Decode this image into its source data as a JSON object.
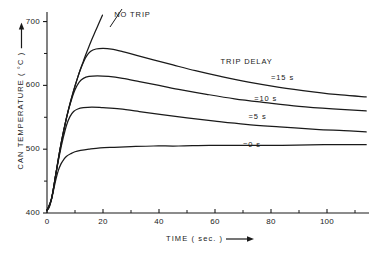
{
  "chart_data": {
    "type": "line",
    "title": "",
    "xlabel": "TIME ( sec. )",
    "ylabel": "CAN TEMPERATURE ( °C )",
    "xlim": [
      0,
      115
    ],
    "ylim": [
      400,
      715
    ],
    "xticks": [
      0,
      20,
      40,
      60,
      80,
      100
    ],
    "xtick_labels": [
      "0",
      "20",
      "40",
      "60",
      "80",
      "100"
    ],
    "xminor": [
      10,
      30,
      50,
      70,
      90,
      110
    ],
    "yticks": [
      400,
      500,
      600,
      700
    ],
    "ytick_labels": [
      "400",
      "500",
      "600",
      "700"
    ],
    "yminor": [
      450,
      550,
      650
    ],
    "grid": false,
    "legend_position": "inline-annotations",
    "annotations": [
      {
        "text": "NO  TRIP",
        "x": 24,
        "y": 710
      },
      {
        "text": "TRIP  DELAY",
        "x": 62,
        "y": 637
      },
      {
        "text": "=15 s",
        "x": 80,
        "y": 612
      },
      {
        "text": "=10 s",
        "x": 74,
        "y": 579
      },
      {
        "text": "=5 s",
        "x": 72,
        "y": 550
      },
      {
        "text": "=0 s",
        "x": 70,
        "y": 507
      }
    ],
    "series": [
      {
        "name": "NO TRIP",
        "points": [
          [
            0.0,
            404
          ],
          [
            0.8,
            410
          ],
          [
            1.6,
            422
          ],
          [
            2.4,
            440
          ],
          [
            3.2,
            462
          ],
          [
            4.0,
            484
          ],
          [
            5.0,
            508
          ],
          [
            6.0,
            530
          ],
          [
            7.0,
            550
          ],
          [
            8.0,
            568
          ],
          [
            9.0,
            584
          ],
          [
            10.0,
            599
          ],
          [
            11.0,
            613
          ],
          [
            12.0,
            626
          ],
          [
            13.0,
            638
          ],
          [
            14.0,
            650
          ],
          [
            15.0,
            661
          ],
          [
            16.0,
            672
          ],
          [
            17.0,
            682
          ],
          [
            18.0,
            692
          ],
          [
            19.0,
            702
          ],
          [
            19.8,
            710
          ]
        ]
      },
      {
        "name": "TRIP DELAY = 15 s",
        "points": [
          [
            0.0,
            404
          ],
          [
            1.6,
            422
          ],
          [
            3.2,
            462
          ],
          [
            5.0,
            508
          ],
          [
            7.0,
            550
          ],
          [
            9.0,
            584
          ],
          [
            11.0,
            613
          ],
          [
            12.5,
            631
          ],
          [
            14.0,
            645
          ],
          [
            15.5,
            653
          ],
          [
            17.5,
            657
          ],
          [
            20.0,
            658
          ],
          [
            23.0,
            657
          ],
          [
            27.0,
            653
          ],
          [
            32.0,
            647
          ],
          [
            38.0,
            640
          ],
          [
            45.0,
            632
          ],
          [
            53.0,
            623
          ],
          [
            62.0,
            614
          ],
          [
            72.0,
            605
          ],
          [
            83.0,
            597
          ],
          [
            95.0,
            590
          ],
          [
            105.0,
            585
          ],
          [
            114.0,
            582
          ]
        ]
      },
      {
        "name": "TRIP DELAY = 10 s",
        "points": [
          [
            0.0,
            404
          ],
          [
            1.6,
            422
          ],
          [
            3.2,
            462
          ],
          [
            5.0,
            508
          ],
          [
            7.0,
            550
          ],
          [
            8.5,
            574
          ],
          [
            10.0,
            593
          ],
          [
            11.5,
            605
          ],
          [
            13.0,
            611
          ],
          [
            15.0,
            614
          ],
          [
            18.0,
            615
          ],
          [
            22.0,
            614
          ],
          [
            27.0,
            611
          ],
          [
            33.0,
            606
          ],
          [
            40.0,
            600
          ],
          [
            48.0,
            593
          ],
          [
            57.0,
            586
          ],
          [
            67.0,
            579
          ],
          [
            78.0,
            573
          ],
          [
            90.0,
            567
          ],
          [
            102.0,
            563
          ],
          [
            114.0,
            560
          ]
        ]
      },
      {
        "name": "TRIP DELAY = 5 s",
        "points": [
          [
            0.0,
            404
          ],
          [
            1.6,
            422
          ],
          [
            3.2,
            462
          ],
          [
            4.5,
            492
          ],
          [
            5.8,
            518
          ],
          [
            7.0,
            538
          ],
          [
            8.2,
            551
          ],
          [
            9.5,
            559
          ],
          [
            11.0,
            563
          ],
          [
            13.0,
            565
          ],
          [
            16.0,
            566
          ],
          [
            20.0,
            565
          ],
          [
            26.0,
            563
          ],
          [
            33.0,
            559
          ],
          [
            41.0,
            554
          ],
          [
            50.0,
            549
          ],
          [
            60.0,
            544
          ],
          [
            71.0,
            539
          ],
          [
            83.0,
            535
          ],
          [
            96.0,
            531
          ],
          [
            106.0,
            529
          ],
          [
            114.0,
            527
          ]
        ]
      },
      {
        "name": "TRIP DELAY = 0 s",
        "points": [
          [
            0.0,
            404
          ],
          [
            0.8,
            409
          ],
          [
            1.6,
            421
          ],
          [
            2.4,
            437
          ],
          [
            3.2,
            453
          ],
          [
            4.0,
            466
          ],
          [
            5.0,
            477
          ],
          [
            6.0,
            484
          ],
          [
            7.0,
            489
          ],
          [
            8.5,
            493
          ],
          [
            10.0,
            496
          ],
          [
            12.0,
            498
          ],
          [
            15.0,
            500
          ],
          [
            19.0,
            502
          ],
          [
            24.0,
            503
          ],
          [
            30.0,
            504
          ],
          [
            38.0,
            505
          ],
          [
            47.0,
            505
          ],
          [
            58.0,
            506
          ],
          [
            70.0,
            506
          ],
          [
            84.0,
            506
          ],
          [
            99.0,
            507
          ],
          [
            114.0,
            507
          ]
        ]
      }
    ]
  },
  "axes": {
    "y_title_text": "CAN TEMPERATURE ( °C )",
    "x_title_text": "TIME ( sec. )"
  }
}
